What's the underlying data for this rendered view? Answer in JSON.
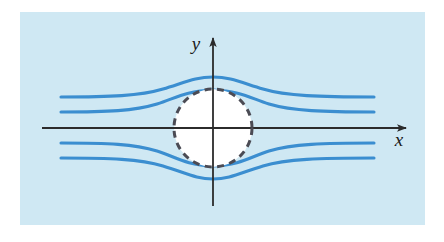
{
  "figure": {
    "panel": {
      "background_color": "#cfe8f3",
      "x": 20,
      "y": 12,
      "width": 405,
      "height": 213
    },
    "page_background_color": "#ffffff"
  },
  "axes": {
    "color": "#2b2b2b",
    "x_axis": {
      "label": "x",
      "label_x": 399,
      "label_y": 146,
      "start_x": 42,
      "end_x": 406,
      "y": 128,
      "arrow": "right-arrow-head"
    },
    "y_axis": {
      "label": "y",
      "label_x": 196,
      "label_y": 50,
      "x": 213,
      "start_y": 206,
      "end_y": 38,
      "arrow": "up-arrow-head"
    },
    "origin": {
      "x": 213,
      "y": 128
    }
  },
  "cylinder": {
    "name": "dashed-circle-boundary",
    "center_x": 213,
    "center_y": 128,
    "radius": 39,
    "stroke_color": "#4b4b54",
    "fill_color": "#ffffff",
    "stroke_width": 3,
    "dash_pattern": "7 5.5"
  },
  "streamlines": {
    "color": "#3b8ed0",
    "stroke_width": 3.1,
    "count": 4,
    "left_edge_x": 61,
    "right_edge_x": 374,
    "paths": [
      {
        "name": "upper-outer-streamline",
        "inlet_y": 97,
        "outlet_y": 97,
        "apex_y": 77,
        "d": "M 61,97 C 110,97 140,96 163,89 C 186,82 196,77 213,77 C 230,77 240,82 263,89 C 286,96 320,97 374,97"
      },
      {
        "name": "upper-inner-streamline",
        "inlet_y": 112,
        "outlet_y": 112,
        "apex_y": 90,
        "d": "M 61,112 C 108,112 134,111 157,104 C 176,98 185,91 213,90 C 241,91 250,98 269,104 C 292,111 324,112 374,112"
      },
      {
        "name": "lower-inner-streamline",
        "inlet_y": 143,
        "outlet_y": 143,
        "apex_y": 166,
        "d": "M 61,143 C 108,143 134,144 157,151 C 176,157 185,165 213,166 C 241,165 250,157 269,151 C 292,144 324,143 374,143"
      },
      {
        "name": "lower-outer-streamline",
        "inlet_y": 158,
        "outlet_y": 158,
        "apex_y": 179,
        "d": "M 61,158 C 110,158 140,159 163,166 C 186,173 196,179 213,179 C 230,179 240,173 263,166 C 286,159 320,158 374,158"
      }
    ]
  }
}
